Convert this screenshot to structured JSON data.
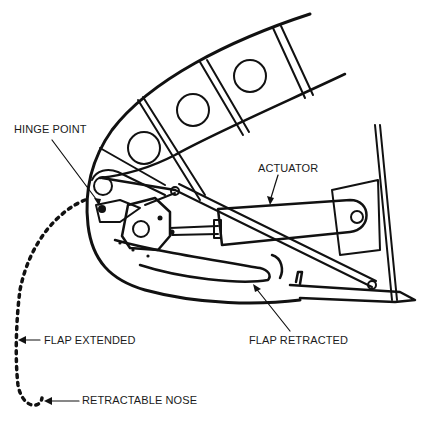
{
  "diagram": {
    "labels": {
      "hinge_point": "HINGE POINT",
      "actuator": "ACTUATOR",
      "flap_extended": "FLAP EXTENDED",
      "flap_retracted": "FLAP RETRACTED",
      "retractable_nose": "RETRACTABLE NOSE"
    },
    "colors": {
      "line": "#111111",
      "background": "#ffffff",
      "text": "#1a1a1a"
    }
  }
}
